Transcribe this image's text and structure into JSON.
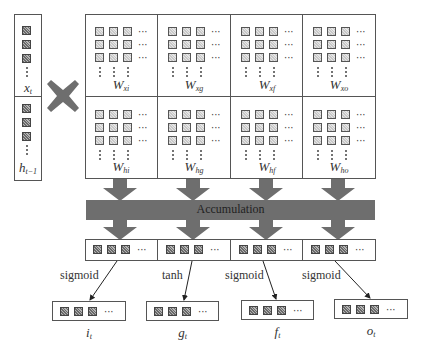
{
  "inputs": {
    "x_label": "x",
    "x_sub": "t",
    "h_label": "h",
    "h_sub": "t−1"
  },
  "operator_icon": "multiply-cross-icon",
  "weights": {
    "input_row": [
      {
        "label": "W",
        "sub": "xi"
      },
      {
        "label": "W",
        "sub": "xg"
      },
      {
        "label": "W",
        "sub": "xf"
      },
      {
        "label": "W",
        "sub": "xo"
      }
    ],
    "hidden_row": [
      {
        "label": "W",
        "sub": "hi"
      },
      {
        "label": "W",
        "sub": "hg"
      },
      {
        "label": "W",
        "sub": "hf"
      },
      {
        "label": "W",
        "sub": "ho"
      }
    ]
  },
  "accumulation": {
    "label": "Accumulation"
  },
  "activations": [
    "sigmoid",
    "tanh",
    "sigmoid",
    "sigmoid"
  ],
  "gates": [
    {
      "label": "i",
      "sub": "t"
    },
    {
      "label": "g",
      "sub": "t"
    },
    {
      "label": "f",
      "sub": "t"
    },
    {
      "label": "o",
      "sub": "t"
    }
  ],
  "ellipsis": "···",
  "colors": {
    "arrow_gray": "#6e6e6e",
    "border": "#555555"
  }
}
